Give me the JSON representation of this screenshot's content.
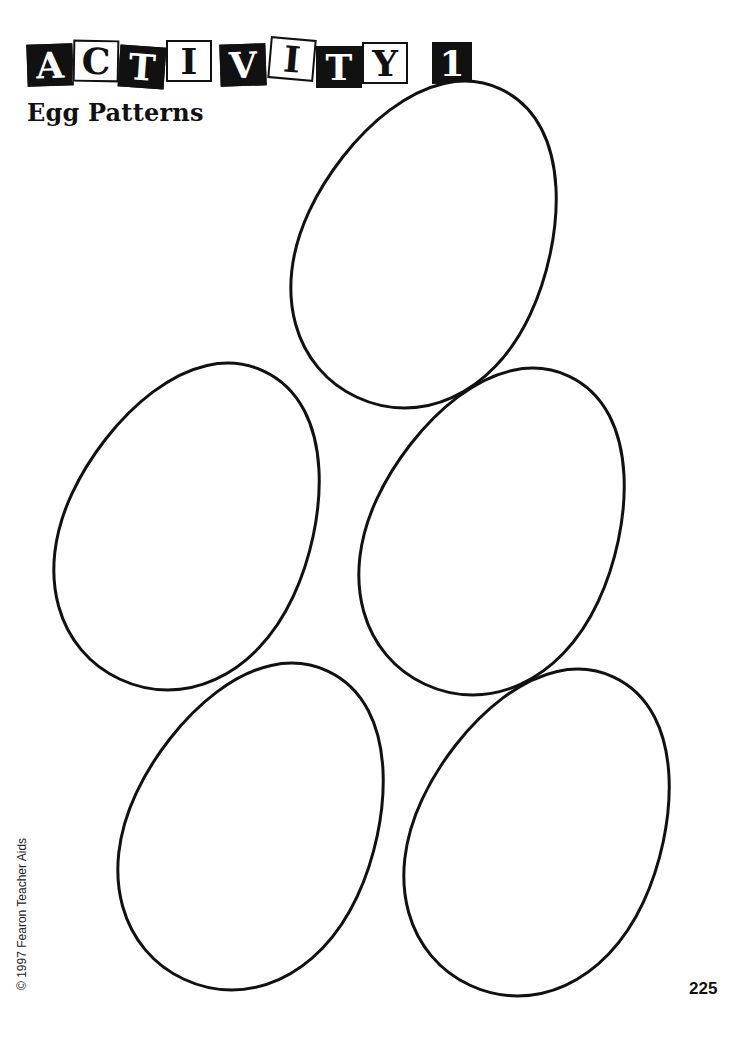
{
  "header": {
    "title_letters": [
      {
        "char": "A",
        "style": "dark"
      },
      {
        "char": "C",
        "style": "light"
      },
      {
        "char": "T",
        "style": "dark"
      },
      {
        "char": "I",
        "style": "light"
      },
      {
        "char": "V",
        "style": "dark"
      },
      {
        "char": "I",
        "style": "light"
      },
      {
        "char": "T",
        "style": "dark"
      },
      {
        "char": "Y",
        "style": "light"
      }
    ],
    "activity_number": "1",
    "title_text": "ACTIVITY 1"
  },
  "subtitle": "Egg Patterns",
  "eggs": {
    "count": 5,
    "outline_color": "#111111",
    "fill_color": "#ffffff"
  },
  "footer": {
    "copyright": "© 1997 Fearon Teacher Aids",
    "page_number": "225"
  }
}
